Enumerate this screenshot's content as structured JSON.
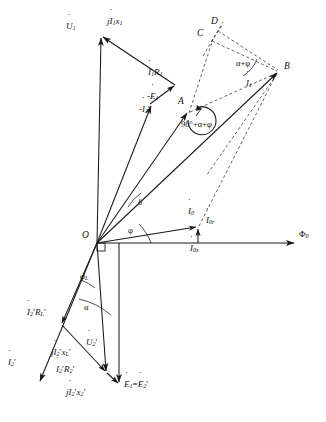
{
  "figure": {
    "type": "phasor-diagram",
    "background": "#ffffff",
    "stroke": "#1a1a1a",
    "dashed_stroke": "#3a3a3a"
  },
  "origin": {
    "label": "O",
    "x": 97,
    "y": 243
  },
  "vectors": [
    {
      "name": "U1",
      "label": "U̇₁",
      "text": "U",
      "sub": "1",
      "from": [
        97,
        243
      ],
      "to": [
        101,
        34
      ],
      "style": "solid",
      "arrow": true
    },
    {
      "name": "mE1",
      "label": "-Ė1",
      "text": "-E",
      "sub": "1",
      "from": [
        97,
        243
      ],
      "to": [
        151,
        103
      ],
      "style": "solid",
      "arrow": true
    },
    {
      "name": "I1R1",
      "label": "İ1R1",
      "text": "I",
      "sub": "1",
      "from": [
        151,
        103
      ],
      "to": [
        175,
        85
      ],
      "style": "solid",
      "arrow": true
    },
    {
      "name": "jI1x1",
      "label": "jİ1x1",
      "text": "jI",
      "sub": "1",
      "from": [
        175,
        85
      ],
      "to": [
        101,
        34
      ],
      "style": "solid",
      "arrow": true
    },
    {
      "name": "I1",
      "label": "İ₁",
      "text": "I",
      "sub": "1",
      "from": [
        97,
        243
      ],
      "to": [
        279,
        72
      ],
      "style": "solid",
      "arrow": true
    },
    {
      "name": "I0",
      "label": "İ₀",
      "text": "I",
      "sub": "0",
      "from": [
        97,
        243
      ],
      "to": [
        198,
        226
      ],
      "style": "solid",
      "arrow": true
    },
    {
      "name": "I0r",
      "label": "İ₀ᵣ",
      "text": "I",
      "sub": "0r",
      "from": [
        198,
        243
      ],
      "to": [
        198,
        226
      ],
      "style": "solid",
      "arrow": true
    },
    {
      "name": "phi0",
      "label": "Φ₀",
      "text": "Φ",
      "sub": "0",
      "from": [
        97,
        243
      ],
      "to": [
        296,
        243
      ],
      "style": "solid",
      "arrow": true
    },
    {
      "name": "mI2",
      "label": "-İ₂'",
      "text": "-I",
      "sub": "2",
      "from": [
        97,
        243
      ],
      "to": [
        188,
        112
      ],
      "style": "solid",
      "arrow": true
    },
    {
      "name": "E1E2",
      "label": "Ė₁=Ė₂'",
      "text": "E",
      "sub": "1",
      "from": [
        119,
        243
      ],
      "to": [
        119,
        385
      ],
      "style": "solid",
      "arrow": true
    },
    {
      "name": "U2",
      "label": "U̇₂'",
      "text": "U",
      "sub": "2",
      "from": [
        97,
        243
      ],
      "to": [
        107,
        373
      ],
      "style": "solid",
      "arrow": true
    },
    {
      "name": "I2",
      "label": "İ₂'",
      "text": "I",
      "sub": "2",
      "from": [
        97,
        243
      ],
      "to": [
        38,
        383
      ],
      "style": "solid",
      "arrow": true
    },
    {
      "name": "I2RL",
      "label": "İ₂'Rʟ'",
      "text": "I",
      "sub": "2",
      "from": [
        97,
        243
      ],
      "to": [
        62,
        325
      ],
      "style": "solid",
      "arrow": true
    },
    {
      "name": "jI2xL",
      "label": "jİ₂'xʟ'",
      "text": "jI",
      "sub": "2",
      "from": [
        62,
        325
      ],
      "to": [
        107,
        373
      ],
      "style": "solid",
      "arrow": true
    },
    {
      "name": "I2R2",
      "label": "İ₂'R₂'",
      "text": "I",
      "sub": "2",
      "from": [
        107,
        373
      ],
      "to": [
        119,
        385
      ],
      "style": "solid",
      "arrow": true
    }
  ],
  "dashed": [
    {
      "name": "A-C",
      "from": [
        189,
        113
      ],
      "to": [
        212,
        40
      ]
    },
    {
      "name": "A-B",
      "from": [
        189,
        113
      ],
      "to": [
        279,
        72
      ]
    },
    {
      "name": "C-B",
      "from": [
        212,
        40
      ],
      "to": [
        279,
        72
      ]
    },
    {
      "name": "D-B",
      "from": [
        219,
        30
      ],
      "to": [
        279,
        72
      ]
    },
    {
      "name": "C-D-ext",
      "from": [
        205,
        52
      ],
      "to": [
        222,
        24
      ]
    },
    {
      "name": "O-B-lower",
      "from": [
        198,
        227
      ],
      "to": [
        279,
        72
      ]
    },
    {
      "name": "B-down",
      "from": [
        279,
        72
      ],
      "to": [
        205,
        173
      ]
    }
  ],
  "points": [
    {
      "name": "A",
      "label": "A",
      "x": 180,
      "y": 104
    },
    {
      "name": "B",
      "label": "B",
      "x": 283,
      "y": 68
    },
    {
      "name": "C",
      "label": "C",
      "x": 200,
      "y": 36
    },
    {
      "name": "D",
      "label": "D",
      "x": 212,
      "y": 23
    },
    {
      "name": "O",
      "label": "O",
      "x": 84,
      "y": 237
    }
  ],
  "angles": [
    {
      "name": "delta",
      "label": "δ",
      "x": 140,
      "y": 203
    },
    {
      "name": "phi",
      "label": "φ",
      "x": 130,
      "y": 232
    },
    {
      "name": "phiL",
      "label": "φʟ",
      "x": 83,
      "y": 277
    },
    {
      "name": "alpha",
      "label": "α",
      "x": 86,
      "y": 307
    },
    {
      "name": "alpha-phi",
      "label": "α+φ",
      "x": 236,
      "y": 64
    },
    {
      "name": "ninety-alpha-phi",
      "label": "90°+α+φ",
      "x": 186,
      "y": 123
    }
  ],
  "labels": {
    "U1": {
      "text": "U",
      "sub": "1",
      "prefix": "",
      "x": 69,
      "y": 26,
      "dot": true
    },
    "jI1x1": {
      "text": "I",
      "sub": "1",
      "prefix": "j",
      "suffix": "x",
      "suffix_sub": "1",
      "x": 110,
      "y": 22,
      "dot": true
    },
    "I1R1": {
      "text": "I",
      "sub": "1",
      "prefix": "",
      "suffix": "R",
      "suffix_sub": "1",
      "x": 150,
      "y": 72,
      "dot": true
    },
    "mE1": {
      "text": "E",
      "sub": "1",
      "prefix": "-",
      "x": 150,
      "y": 96,
      "dot": true
    },
    "mI2p": {
      "text": "I",
      "sub": "2",
      "prefix": "-",
      "prime": true,
      "x": 143,
      "y": 110,
      "dot": true
    },
    "I1": {
      "text": "I",
      "sub": "1",
      "prefix": "",
      "x": 247,
      "y": 83,
      "dot": true
    },
    "I0": {
      "text": "I",
      "sub": "0",
      "prefix": "",
      "x": 190,
      "y": 212,
      "dot": true
    },
    "I0r": {
      "text": "I",
      "sub": "0r",
      "prefix": "",
      "x": 207,
      "y": 221,
      "dot": true
    },
    "I0x": {
      "text": "I",
      "sub": "0x",
      "prefix": "",
      "x": 193,
      "y": 246,
      "dot": true
    },
    "phi0": {
      "text": "Φ",
      "sub": "0",
      "prefix": "",
      "x": 300,
      "y": 234,
      "dot": false
    },
    "I2p": {
      "text": "I",
      "sub": "2",
      "prefix": "",
      "prime": true,
      "x": 10,
      "y": 363,
      "dot": true
    },
    "I2RL": {
      "text": "I",
      "sub": "2",
      "prefix": "",
      "prime": true,
      "suffix": "R",
      "suffix_sub": "L",
      "suffix_prime": true,
      "x": 30,
      "y": 313,
      "dot": true
    },
    "jI2xL": {
      "text": "I",
      "sub": "2",
      "prefix": "j",
      "prime": true,
      "suffix": "x",
      "suffix_sub": "L",
      "suffix_prime": true,
      "x": 54,
      "y": 353,
      "dot": true
    },
    "I2R2": {
      "text": "I",
      "sub": "2",
      "prefix": "",
      "prime": true,
      "suffix": "R",
      "suffix_sub": "2",
      "suffix_prime": true,
      "x": 59,
      "y": 369,
      "dot": true
    },
    "jI2x2": {
      "text": "I",
      "sub": "2",
      "prefix": "j",
      "prime": true,
      "suffix": "x",
      "suffix_sub": "2",
      "suffix_prime": true,
      "x": 70,
      "y": 392,
      "dot": true
    },
    "U2p": {
      "text": "U",
      "sub": "2",
      "prefix": "",
      "prime": true,
      "x": 88,
      "y": 343,
      "dot": true
    },
    "E1E2": {
      "text": "E",
      "sub": "1",
      "prefix": "",
      "eq": "=",
      "text2": "E",
      "sub2": "2",
      "prime2": true,
      "x": 126,
      "y": 385,
      "dot": true
    }
  },
  "right_angle_marker": {
    "name": "origin-right-angle",
    "x": 97,
    "y": 243,
    "size": 8
  }
}
